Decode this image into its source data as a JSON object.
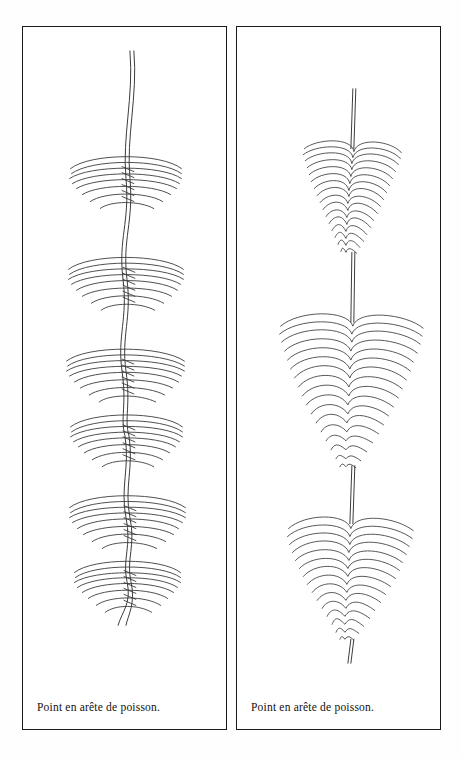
{
  "page": {
    "background_color": "#ffffff",
    "ink_color": "#2b2b2b",
    "border_color": "#1a1a1a",
    "width": 461,
    "height": 759
  },
  "panels": [
    {
      "id": "left",
      "caption": "Point en arête de poisson.",
      "figure_name": "fishbone-stitch-open-diagram",
      "description_alt": "Diagramme de broderie : point en arête de poisson, version ouverte espacée",
      "diagram": {
        "type": "embroidery-stitch-diagram",
        "style": "line-drawing",
        "spine": "wavy-double-thread",
        "cluster_count": 6,
        "cluster_shape": "nested-arcs",
        "arcs_per_cluster": 7,
        "cluster_centers_y": [
          152,
          253,
          345,
          410,
          492,
          556
        ],
        "cluster_half_width": [
          56,
          58,
          60,
          56,
          58,
          52
        ],
        "spine_x": 126,
        "thread_top_y": 50,
        "thread_bottom_y": 612
      }
    },
    {
      "id": "right",
      "caption": "Point en arête de poisson.",
      "figure_name": "fishbone-stitch-dense-diagram",
      "description_alt": "Diagramme de broderie : point en arête de poisson, version dense en cône",
      "diagram": {
        "type": "embroidery-stitch-diagram",
        "style": "line-drawing",
        "spine": "straight-double-thread",
        "cluster_count": 3,
        "cluster_shape": "nested-chevron-cone",
        "chevrons_per_cluster": 16,
        "cluster_tops_y": [
          118,
          290,
          492
        ],
        "cluster_heights": [
          110,
          150,
          128
        ],
        "cluster_widths": [
          96,
          150,
          126
        ],
        "spine_x": 352,
        "thread_top_y": 88,
        "thread_bottom_y": 620
      }
    }
  ]
}
